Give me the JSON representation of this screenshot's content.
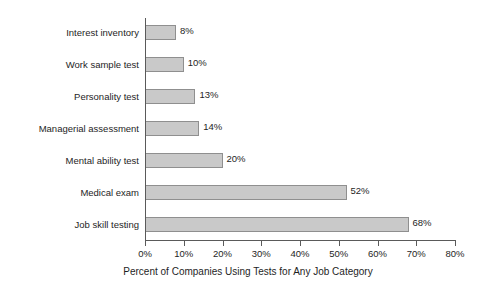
{
  "chart_data": {
    "type": "bar",
    "orientation": "horizontal",
    "title": "",
    "subtitle": "",
    "xlabel": "Percent of Companies Using Tests for Any Job Category",
    "ylabel": "",
    "categories": [
      "Interest inventory",
      "Work sample test",
      "Personality test",
      "Managerial assessment",
      "Mental ability test",
      "Medical exam",
      "Job skill testing"
    ],
    "values": [
      8,
      10,
      13,
      14,
      20,
      52,
      68
    ],
    "value_labels": [
      "8%",
      "10%",
      "13%",
      "14%",
      "20%",
      "52%",
      "68%"
    ],
    "xlim": [
      0,
      80
    ],
    "xticks": [
      0,
      10,
      20,
      30,
      40,
      50,
      60,
      70,
      80
    ],
    "xtick_labels": [
      "0%",
      "10%",
      "20%",
      "30%",
      "40%",
      "50%",
      "60%",
      "70%",
      "80%"
    ],
    "grid": false,
    "legend": null,
    "bar_fill_color": "#c9c9c9",
    "bar_border_color": "#8f8f8f",
    "axis_color": "#5a5a5a",
    "text_color": "#1e1e1e",
    "background_color": "#ffffff"
  }
}
